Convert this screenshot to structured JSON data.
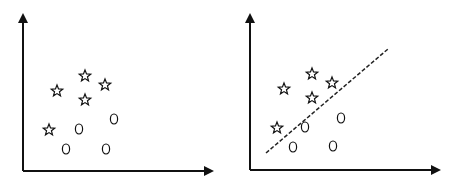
{
  "chart_data": [
    {
      "type": "scatter",
      "title": "",
      "xlabel": "",
      "ylabel": "",
      "series": [
        {
          "name": "star",
          "marker": "star",
          "points": [
            [
              57,
              91
            ],
            [
              85,
              76
            ],
            [
              105,
              85
            ],
            [
              85,
              100
            ],
            [
              49,
              130
            ]
          ]
        },
        {
          "name": "circle",
          "marker": "circle",
          "points": [
            [
              79,
              129
            ],
            [
              114,
              119
            ],
            [
              66,
              149
            ],
            [
              106,
              149
            ]
          ]
        }
      ],
      "grid": false,
      "legend": null
    },
    {
      "type": "scatter",
      "title": "",
      "xlabel": "",
      "ylabel": "",
      "series": [
        {
          "name": "star",
          "marker": "star",
          "points": [
            [
              284,
              89
            ],
            [
              312,
              74
            ],
            [
              332,
              83
            ],
            [
              312,
              98
            ],
            [
              277,
              128
            ]
          ]
        },
        {
          "name": "circle",
          "marker": "circle",
          "points": [
            [
              305,
              127
            ],
            [
              341,
              118
            ],
            [
              293,
              147
            ],
            [
              333,
              146
            ]
          ]
        }
      ],
      "decision_boundary": {
        "style": "dashed",
        "from": [
          266,
          153
        ],
        "to": [
          388,
          49
        ]
      },
      "grid": false,
      "legend": null
    }
  ],
  "colors": {
    "ink": "#111111",
    "background": "#ffffff"
  }
}
